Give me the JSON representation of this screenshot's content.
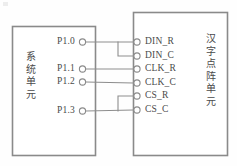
{
  "diagram": {
    "line_color": "#8d8d8d",
    "box_stroke_color": "#8a8a8a",
    "text_color": "#4a4a4a",
    "background_color": "#fefefe"
  },
  "left_unit": {
    "name": "system-unit",
    "label": "系统单元",
    "pins": [
      {
        "label": "P1.0",
        "y": 42
      },
      {
        "label": "P1.1",
        "y": 69
      },
      {
        "label": "P1.2",
        "y": 82
      },
      {
        "label": "P1.3",
        "y": 111
      }
    ]
  },
  "right_unit": {
    "name": "chinese-character-dot-matrix-unit",
    "label": "汉字点阵单元",
    "pins": [
      {
        "label": "DIN_R",
        "y": 42
      },
      {
        "label": "DIN_C",
        "y": 56
      },
      {
        "label": "CLK_R",
        "y": 69
      },
      {
        "label": "CLK_C",
        "y": 83
      },
      {
        "label": "CS_R",
        "y": 96
      },
      {
        "label": "CS_C",
        "y": 110
      }
    ]
  },
  "connections": [
    {
      "from": "P1.0",
      "to": [
        "DIN_R",
        "DIN_C"
      ]
    },
    {
      "from": "P1.1",
      "to": [
        "CLK_R"
      ]
    },
    {
      "from": "P1.2",
      "to": [
        "CLK_C"
      ]
    },
    {
      "from": "P1.3",
      "to": [
        "CS_R",
        "CS_C"
      ]
    }
  ]
}
